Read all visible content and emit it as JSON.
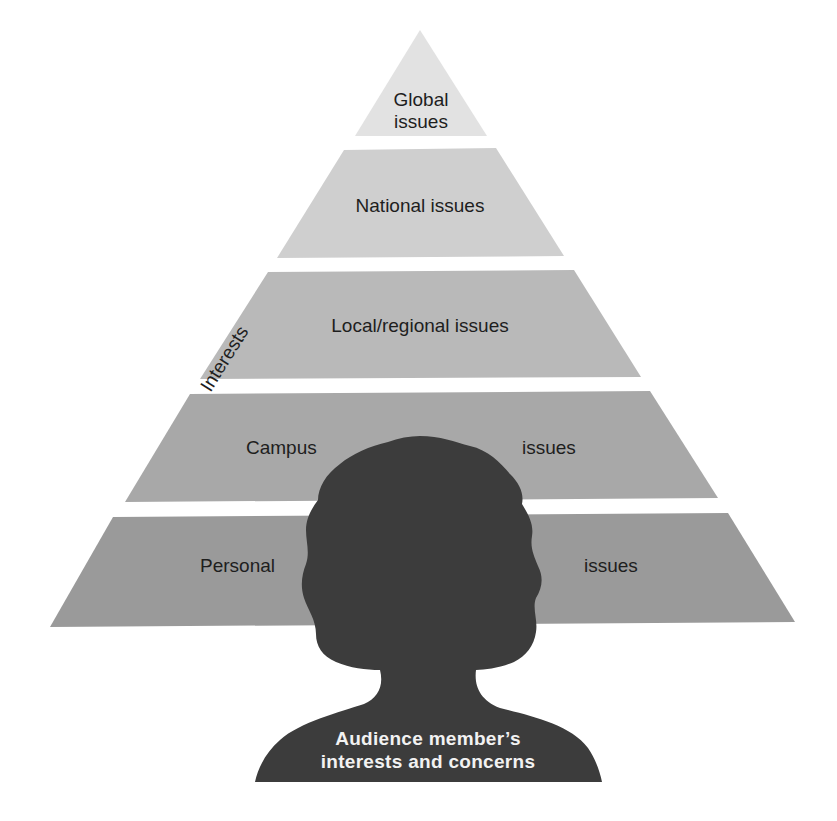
{
  "diagram": {
    "type": "pyramid",
    "axis_label": "Interests",
    "tiers": [
      {
        "level": 1,
        "label_line1": "Global",
        "label_line2": "issues",
        "fill": "#e2e2e2"
      },
      {
        "level": 2,
        "label": "National issues",
        "fill": "#cfcfcf"
      },
      {
        "level": 3,
        "label": "Local/regional issues",
        "fill": "#b9b9b9"
      },
      {
        "level": 4,
        "label_left": "Campus",
        "label_right": "issues",
        "fill": "#a8a8a8"
      },
      {
        "level": 5,
        "label_left": "Personal",
        "label_right": "issues",
        "fill": "#9a9a9a"
      }
    ],
    "silhouette": {
      "caption_line1": "Audience member’s",
      "caption_line2": "interests and concerns",
      "fill": "#3c3c3c"
    }
  }
}
